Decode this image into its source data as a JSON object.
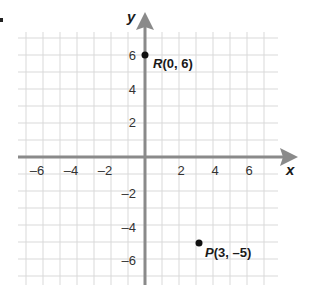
{
  "chart_data": {
    "type": "scatter",
    "title": "",
    "xlabel": "x",
    "ylabel": "y",
    "xlim": [
      -7,
      7
    ],
    "ylim": [
      -7,
      7
    ],
    "grid": true,
    "x_tick_labels": [
      "-6",
      "-4",
      "-2",
      "2",
      "4",
      "6"
    ],
    "x_ticks": [
      -6,
      -4,
      -2,
      2,
      4,
      6
    ],
    "y_tick_labels": [
      "6",
      "4",
      "2",
      "-2",
      "-4",
      "-6"
    ],
    "y_ticks": [
      6,
      4,
      2,
      -2,
      -4,
      -6
    ],
    "points": [
      {
        "name": "R",
        "x": 0,
        "y": 6,
        "label": "R(0, 6)",
        "label_name": "R",
        "label_coords": "(0, 6)"
      },
      {
        "name": "P",
        "x": 3,
        "y": -5,
        "label": "P(3, –5)",
        "label_name": "P",
        "label_coords": "(3, –5)"
      }
    ]
  },
  "axes": {
    "x_title": "x",
    "y_title": "y",
    "color": "#8a8a8a"
  },
  "grid": {
    "color": "#d9d9d9"
  },
  "labels": {
    "x": [
      "–6",
      "–4",
      "–2",
      "2",
      "4",
      "6"
    ],
    "y": [
      "6",
      "4",
      "2",
      "–2",
      "–4",
      "–6"
    ]
  }
}
